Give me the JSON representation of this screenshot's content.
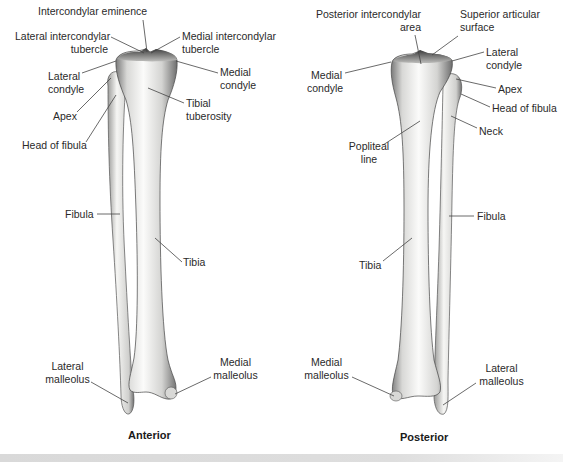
{
  "figure": {
    "background": "#ffffff",
    "bone_color": "#f3f3f1",
    "bone_shade": "#9a9a9a",
    "line_color": "#444444"
  },
  "views": [
    {
      "id": "anterior",
      "caption": "Anterior",
      "caption_pos": [
        128,
        429
      ],
      "labels": [
        {
          "text": "Intercondylar eminence",
          "x": 38,
          "y": 5,
          "align": "l",
          "line": [
            [
              143,
              20
            ],
            [
              147,
              52
            ]
          ]
        },
        {
          "text": "Lateral intercondylar\ntubercle",
          "x": 15,
          "y": 30,
          "align": "r",
          "w": 93,
          "line": [
            [
              111,
              37
            ],
            [
              144,
              53
            ]
          ]
        },
        {
          "text": "Medial intercondylar\ntubercle",
          "x": 182,
          "y": 30,
          "align": "l",
          "line": [
            [
              180,
              37
            ],
            [
              151,
              53
            ]
          ]
        },
        {
          "text": "Lateral\ncondyle",
          "x": 48,
          "y": 70,
          "align": "r",
          "w": 32,
          "line": [
            [
              82,
              73
            ],
            [
              116,
              61
            ]
          ]
        },
        {
          "text": "Medial\ncondyle",
          "x": 220,
          "y": 66,
          "align": "l",
          "line": [
            [
              218,
              73
            ],
            [
              176,
              61
            ]
          ]
        },
        {
          "text": "Tibial\ntuberosity",
          "x": 186,
          "y": 97,
          "align": "l",
          "line": [
            [
              184,
              103
            ],
            [
              148,
              88
            ]
          ]
        },
        {
          "text": "Apex",
          "x": 53,
          "y": 110,
          "align": "l",
          "line": [
            [
              77,
              112
            ],
            [
              111,
              78
            ]
          ]
        },
        {
          "text": "Head of fibula",
          "x": 22,
          "y": 139,
          "align": "l",
          "line": [
            [
              86,
              142
            ],
            [
              116,
              95
            ]
          ]
        },
        {
          "text": "Fibula",
          "x": 65,
          "y": 208,
          "align": "l",
          "line": [
            [
              97,
              214
            ],
            [
              120,
              214
            ]
          ]
        },
        {
          "text": "Tibia",
          "x": 183,
          "y": 256,
          "align": "l",
          "line": [
            [
              182,
              262
            ],
            [
              155,
              238
            ]
          ]
        },
        {
          "text": "Lateral\nmalleolus",
          "x": 45,
          "y": 360,
          "align": "c",
          "w": 45,
          "line": [
            [
              91,
              382
            ],
            [
              128,
              403
            ]
          ]
        },
        {
          "text": "Medial\nmalleolus",
          "x": 213,
          "y": 356,
          "align": "c",
          "w": 45,
          "line": [
            [
              211,
              377
            ],
            [
              175,
              394
            ]
          ]
        }
      ]
    },
    {
      "id": "posterior",
      "caption": "Posterior",
      "caption_pos": [
        400,
        431
      ],
      "labels": [
        {
          "text": "Posterior intercondylar\narea",
          "x": 311,
          "y": 8,
          "align": "r",
          "w": 110,
          "line": [
            [
              415,
              35
            ],
            [
              421,
              64
            ]
          ]
        },
        {
          "text": "Superior articular\nsurface",
          "x": 460,
          "y": 8,
          "align": "l",
          "line": [
            [
              458,
              36
            ],
            [
              432,
              55
            ]
          ]
        },
        {
          "text": "Lateral\ncondyle",
          "x": 486,
          "y": 46,
          "align": "l",
          "line": [
            [
              484,
              52
            ],
            [
              452,
              61
            ]
          ]
        },
        {
          "text": "Medial\ncondyle",
          "x": 307,
          "y": 69,
          "align": "r",
          "w": 35,
          "line": [
            [
              345,
              73
            ],
            [
              391,
              62
            ]
          ]
        },
        {
          "text": "Apex",
          "x": 498,
          "y": 83,
          "align": "l",
          "line": [
            [
              496,
              88
            ],
            [
              456,
              79
            ]
          ]
        },
        {
          "text": "Head of fibula",
          "x": 492,
          "y": 102,
          "align": "l",
          "line": [
            [
              490,
              107
            ],
            [
              461,
              94
            ]
          ]
        },
        {
          "text": "Neck",
          "x": 479,
          "y": 125,
          "align": "l",
          "line": [
            [
              477,
              128
            ],
            [
              451,
              116
            ]
          ]
        },
        {
          "text": "Popliteal\nline",
          "x": 345,
          "y": 140,
          "align": "c",
          "w": 48,
          "line": [
            [
              383,
              145
            ],
            [
              420,
              121
            ]
          ]
        },
        {
          "text": "Fibula",
          "x": 477,
          "y": 210,
          "align": "l",
          "line": [
            [
              474,
              216
            ],
            [
              449,
              216
            ]
          ]
        },
        {
          "text": "Tibia",
          "x": 359,
          "y": 259,
          "align": "l",
          "line": [
            [
              383,
              261
            ],
            [
              412,
              238
            ]
          ]
        },
        {
          "text": "Medial\nmalleolus",
          "x": 304,
          "y": 356,
          "align": "c",
          "w": 45,
          "line": [
            [
              352,
              377
            ],
            [
              394,
              396
            ]
          ]
        },
        {
          "text": "Lateral\nmalleolus",
          "x": 479,
          "y": 362,
          "align": "c",
          "w": 45,
          "line": [
            [
              476,
              383
            ],
            [
              443,
              405
            ]
          ]
        }
      ]
    }
  ]
}
